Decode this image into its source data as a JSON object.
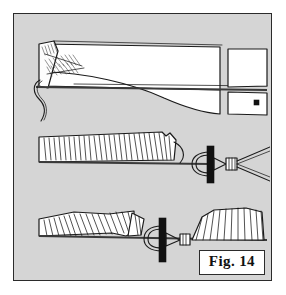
{
  "figure": {
    "label": "Fig. 14",
    "caption_text": "Fig. 14",
    "background_color": "#d5d5d5",
    "border_color": "#2b2b2b",
    "ink_color": "#1a1a1a",
    "fill_color": "#ffffff",
    "accent_color": "#111111",
    "panel_count": 3,
    "panels": [
      {
        "id": "panel-top",
        "name": "feather-quill-overview",
        "description": "Long tapered feather quill viewed flat, hatched stripped barb stubs at the left butt end, a curved tying thread hanging from the butt, a long horizontal stem line running the full width, and a separate rectangular panel at the right end bearing a small solid black square marker."
      },
      {
        "id": "panel-middle",
        "name": "barb-strip-with-pliers",
        "description": "Horizontal strip of closely spaced upright feather barbs along a straight stem; at the right end a hackle plier tool grips the stem, drawn as an open loop crossed by a solid black vertical bar with a small wedge clamp and two splayed tail wires."
      },
      {
        "id": "panel-bottom",
        "name": "split-barbs-with-pliers",
        "description": "Two separated blocks of feather barbs sweeping in opposite directions along one stem, with the same hackle plier tool — loop, solid black vertical bar and wedge clamp — positioned at the gap between the two barb blocks."
      }
    ],
    "markers": {
      "black_square_dot": "solid black square index marker on the right-hand rectangular panel of the top view"
    },
    "tool": {
      "name": "hackle-pliers",
      "parts": [
        "wire loop",
        "black jaw bar",
        "wedge clamp",
        "splayed tail wires"
      ]
    }
  }
}
